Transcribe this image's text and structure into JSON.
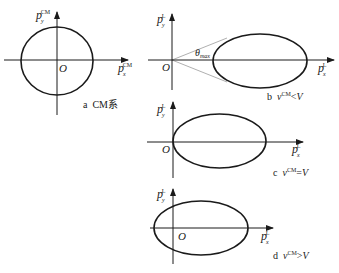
{
  "figure": {
    "panels": [
      {
        "id": "a",
        "caption_letter": "a",
        "caption_text": "CM系",
        "y_axis_label": "p",
        "y_axis_sub": "y",
        "y_axis_sup": "CM",
        "x_axis_label": "p",
        "x_axis_sub": "x",
        "x_axis_sup": "CM",
        "origin_label": "O",
        "shape": "circle"
      },
      {
        "id": "b",
        "caption_letter": "b",
        "caption_v": "v",
        "caption_sup": "CM",
        "caption_rel": "<",
        "caption_V": "V",
        "y_axis_label": "p",
        "y_axis_sub": "y",
        "y_axis_sup": "L",
        "x_axis_label": "p",
        "x_axis_sub": "x",
        "x_axis_sup": "L",
        "origin_label": "O",
        "angle_label": "θ",
        "angle_sub": "max",
        "shape": "ellipse-offset"
      },
      {
        "id": "c",
        "caption_letter": "c",
        "caption_v": "v",
        "caption_sup": "CM",
        "caption_rel": "=",
        "caption_V": "V",
        "y_axis_label": "p",
        "y_axis_sub": "y",
        "y_axis_sup": "L",
        "x_axis_label": "p",
        "x_axis_sub": "x",
        "x_axis_sup": "L",
        "origin_label": "O",
        "shape": "ellipse-touching-origin"
      },
      {
        "id": "d",
        "caption_letter": "d",
        "caption_v": "v",
        "caption_sup": "CM",
        "caption_rel": ">",
        "caption_V": "V",
        "y_axis_label": "p",
        "y_axis_sub": "y",
        "y_axis_sup": "L",
        "x_axis_label": "p",
        "x_axis_sub": "x",
        "x_axis_sup": "L",
        "origin_label": "O",
        "shape": "ellipse-containing-origin"
      }
    ]
  }
}
